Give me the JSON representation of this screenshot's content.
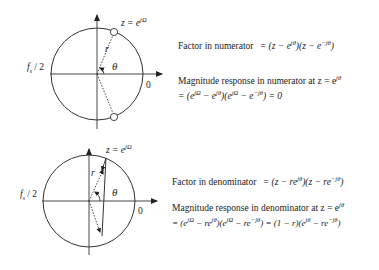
{
  "top_diagram": {
    "z_label": "z = e",
    "z_sup": "jΩ",
    "r_label": "r",
    "theta_label": "θ",
    "left_label": "fs / 2",
    "left_label_main": "f",
    "left_label_sub": "s",
    "left_label_rest": " / 2",
    "zero_label": "0",
    "markers": "zeros (circles)"
  },
  "top_text": {
    "factor_label": "Factor in numerator",
    "factor_expr_a": "= (z − e",
    "factor_sup_a": "jθ",
    "factor_expr_b": ")(z − e",
    "factor_sup_b": "−jθ",
    "factor_expr_c": ")",
    "mag_label": "Magnitude response in numerator at z = e",
    "mag_sup": "jθ",
    "mag_expr_1": "= (e",
    "mag_sup_1": "jΩ",
    "mag_expr_2": " − e",
    "mag_sup_2": "jθ",
    "mag_expr_3": ")(e",
    "mag_sup_3": "jΩ",
    "mag_expr_4": " − e",
    "mag_sup_4": "−jθ",
    "mag_expr_5": ") = 0"
  },
  "bottom_diagram": {
    "z_label": "z = e",
    "z_sup": "jΩ",
    "r_label": "r",
    "theta_label": "θ",
    "left_label_main": "f",
    "left_label_sub": "s",
    "left_label_rest": " / 2",
    "zero_label": "0",
    "markers": "poles (arrows)"
  },
  "bottom_text": {
    "factor_label": "Factor in denominator",
    "factor_expr_a": "= (z − re",
    "factor_sup_a": "jθ",
    "factor_expr_b": ")(z − re",
    "factor_sup_b": "−jθ",
    "factor_expr_c": ")",
    "mag_label": "Magnitude response in denominator at z = e",
    "mag_sup": "jθ",
    "mag_expr_1": "= (e",
    "mag_sup_1": "jΩ",
    "mag_expr_2": " − re",
    "mag_sup_2": "jθ",
    "mag_expr_3": ")(e",
    "mag_sup_3": "jΩ",
    "mag_expr_4": " − re",
    "mag_sup_4": "−jθ",
    "mag_expr_5": ") = (1 − r)(e",
    "mag_sup_5": "jθ",
    "mag_expr_6": " − re",
    "mag_sup_6": "−jθ",
    "mag_expr_7": ")"
  }
}
